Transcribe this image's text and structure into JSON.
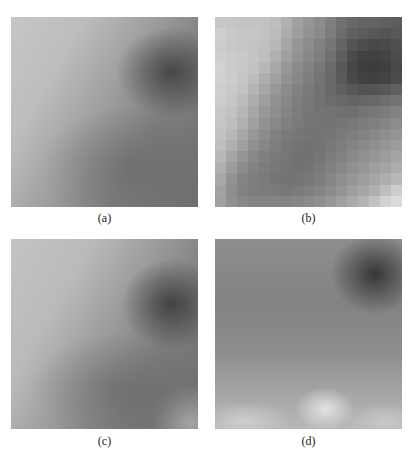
{
  "figure": {
    "panels": [
      {
        "id": "a",
        "caption": "(a)",
        "description": "smooth grayscale image patch"
      },
      {
        "id": "b",
        "caption": "(b)",
        "description": "low-resolution blocky grayscale patch"
      },
      {
        "id": "c",
        "caption": "(c)",
        "description": "smooth noisy grayscale image patch"
      },
      {
        "id": "d",
        "caption": "(d)",
        "description": "smooth grayscale patch with bright lower regions"
      }
    ],
    "panel_b_grid": [
      [
        200,
        198,
        196,
        196,
        194,
        190,
        176,
        160,
        150,
        140,
        128,
        112,
        104,
        100,
        100,
        96,
        92
      ],
      [
        206,
        200,
        198,
        198,
        194,
        188,
        172,
        158,
        146,
        138,
        124,
        108,
        96,
        92,
        88,
        84,
        88
      ],
      [
        204,
        200,
        198,
        196,
        192,
        184,
        166,
        150,
        140,
        130,
        118,
        100,
        84,
        76,
        72,
        74,
        80
      ],
      [
        206,
        202,
        200,
        196,
        190,
        176,
        160,
        146,
        136,
        126,
        112,
        94,
        74,
        66,
        64,
        68,
        76
      ],
      [
        210,
        204,
        200,
        194,
        184,
        168,
        152,
        140,
        130,
        120,
        106,
        88,
        70,
        62,
        60,
        64,
        72
      ],
      [
        208,
        204,
        198,
        188,
        174,
        160,
        146,
        136,
        126,
        116,
        104,
        90,
        74,
        66,
        64,
        68,
        76
      ],
      [
        206,
        202,
        194,
        180,
        166,
        152,
        140,
        130,
        122,
        114,
        104,
        96,
        88,
        84,
        84,
        88,
        96
      ],
      [
        204,
        198,
        188,
        172,
        158,
        146,
        136,
        126,
        120,
        114,
        108,
        104,
        100,
        102,
        104,
        110,
        116
      ],
      [
        200,
        194,
        182,
        166,
        152,
        142,
        132,
        124,
        118,
        116,
        114,
        112,
        112,
        116,
        120,
        124,
        130
      ],
      [
        198,
        190,
        176,
        160,
        146,
        136,
        128,
        122,
        118,
        116,
        116,
        118,
        120,
        124,
        128,
        134,
        140
      ],
      [
        194,
        184,
        168,
        152,
        140,
        130,
        122,
        118,
        116,
        116,
        118,
        122,
        126,
        130,
        136,
        142,
        148
      ],
      [
        190,
        176,
        160,
        144,
        134,
        126,
        120,
        116,
        114,
        116,
        120,
        126,
        132,
        138,
        144,
        150,
        156
      ],
      [
        184,
        166,
        150,
        136,
        128,
        122,
        118,
        114,
        114,
        118,
        124,
        130,
        138,
        144,
        150,
        156,
        164
      ],
      [
        176,
        156,
        140,
        130,
        124,
        120,
        116,
        114,
        116,
        122,
        128,
        136,
        144,
        150,
        158,
        164,
        172
      ],
      [
        168,
        146,
        132,
        126,
        122,
        118,
        116,
        116,
        120,
        126,
        134,
        142,
        150,
        158,
        166,
        174,
        184
      ],
      [
        162,
        142,
        130,
        126,
        124,
        122,
        120,
        122,
        126,
        132,
        140,
        148,
        158,
        166,
        176,
        190,
        204
      ],
      [
        160,
        144,
        136,
        132,
        132,
        132,
        132,
        134,
        138,
        144,
        152,
        160,
        170,
        180,
        194,
        210,
        220
      ]
    ]
  }
}
